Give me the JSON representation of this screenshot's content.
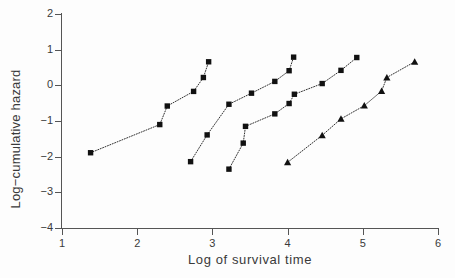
{
  "chart_data": {
    "type": "line",
    "title": "",
    "subtitle": "",
    "xlabel": "Log of survival time",
    "ylabel": "Log−cumulative hazard",
    "xlim": [
      1,
      6
    ],
    "ylim": [
      -4,
      2
    ],
    "xticks": [
      1,
      2,
      3,
      4,
      5,
      6
    ],
    "xticklabels": [
      "1",
      "2",
      "3",
      "4",
      "5",
      "6"
    ],
    "yticks": [
      -4,
      -3,
      -2,
      -1,
      0,
      1,
      2
    ],
    "yticklabels": [
      "−4",
      "−3",
      "−2",
      "−1",
      "0",
      "1",
      "2"
    ],
    "grid": false,
    "legend": null,
    "legend_position": "none",
    "linestyle": "dotted",
    "line_color": "#1a1a1a",
    "marker_color": "#111111",
    "annotations": [],
    "series": [
      {
        "name": "Group 1",
        "marker": "square",
        "points": [
          {
            "x": 1.38,
            "y": -1.89
          },
          {
            "x": 2.3,
            "y": -1.1
          },
          {
            "x": 2.4,
            "y": -0.58
          },
          {
            "x": 2.75,
            "y": -0.17
          },
          {
            "x": 2.88,
            "y": 0.22
          },
          {
            "x": 2.95,
            "y": 0.66
          }
        ]
      },
      {
        "name": "Group 2",
        "marker": "square",
        "points": [
          {
            "x": 2.71,
            "y": -2.14
          },
          {
            "x": 2.93,
            "y": -1.39
          },
          {
            "x": 3.22,
            "y": -0.53
          },
          {
            "x": 3.52,
            "y": -0.22
          },
          {
            "x": 3.83,
            "y": 0.11
          },
          {
            "x": 4.02,
            "y": 0.41
          },
          {
            "x": 4.08,
            "y": 0.79
          }
        ]
      },
      {
        "name": "Group 3",
        "marker": "square",
        "points": [
          {
            "x": 3.22,
            "y": -2.35
          },
          {
            "x": 3.41,
            "y": -1.62
          },
          {
            "x": 3.44,
            "y": -1.15
          },
          {
            "x": 3.83,
            "y": -0.8
          },
          {
            "x": 4.02,
            "y": -0.51
          },
          {
            "x": 4.09,
            "y": -0.25
          },
          {
            "x": 4.46,
            "y": 0.05
          },
          {
            "x": 4.71,
            "y": 0.42
          },
          {
            "x": 4.92,
            "y": 0.78
          }
        ]
      },
      {
        "name": "Group 4",
        "marker": "triangle",
        "points": [
          {
            "x": 4.0,
            "y": -2.16
          },
          {
            "x": 4.46,
            "y": -1.4
          },
          {
            "x": 4.71,
            "y": -0.94
          },
          {
            "x": 5.02,
            "y": -0.57
          },
          {
            "x": 5.25,
            "y": -0.16
          },
          {
            "x": 5.32,
            "y": 0.22
          },
          {
            "x": 5.69,
            "y": 0.66
          }
        ]
      }
    ]
  }
}
